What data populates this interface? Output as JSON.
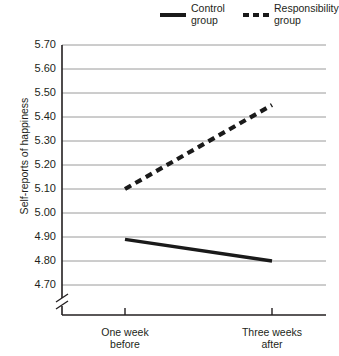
{
  "chart_data": {
    "type": "line",
    "title": "",
    "xlabel": "",
    "ylabel": "Self-reports of happiness",
    "categories": [
      "One week before",
      "Three weeks after"
    ],
    "ylim": [
      4.7,
      5.7
    ],
    "yticks": [
      "4.70",
      "4.80",
      "4.90",
      "5.00",
      "5.10",
      "5.20",
      "5.30",
      "5.40",
      "5.50",
      "5.60",
      "5.70"
    ],
    "grid": true,
    "axis_break": true,
    "legend_position": "top-right",
    "series": [
      {
        "name": "Control group",
        "style": "solid",
        "color": "#1a1a1a",
        "values": [
          4.89,
          4.8
        ]
      },
      {
        "name": "Responsibility group",
        "style": "dashed",
        "color": "#1a1a1a",
        "values": [
          5.1,
          5.45
        ]
      }
    ]
  },
  "legend": {
    "control": {
      "line1": "Control",
      "line2": "group"
    },
    "responsibility": {
      "line1": "Responsibility",
      "line2": "group"
    }
  },
  "xaxis": {
    "tick1": {
      "line1": "One week",
      "line2": "before"
    },
    "tick2": {
      "line1": "Three weeks",
      "line2": "after"
    }
  },
  "yaxis": {
    "title": "Self-reports of happiness"
  }
}
